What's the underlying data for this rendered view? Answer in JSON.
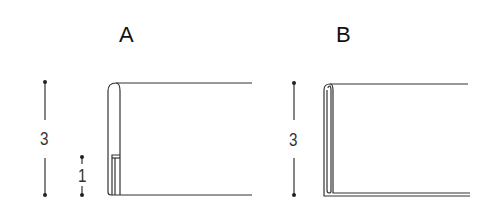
{
  "diagram": {
    "panels": [
      {
        "id": "A",
        "label": "A",
        "dimensions": [
          {
            "value": "3",
            "description": "overall height"
          },
          {
            "value": "1",
            "description": "inner return height"
          }
        ]
      },
      {
        "id": "B",
        "label": "B",
        "dimensions": [
          {
            "value": "3",
            "description": "overall height"
          }
        ]
      }
    ],
    "colors": {
      "line": "#333333",
      "background": "#ffffff"
    }
  }
}
